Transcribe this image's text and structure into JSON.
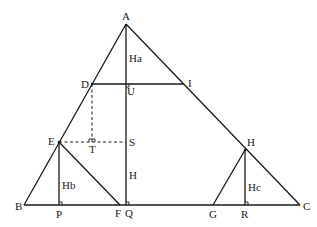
{
  "diagram": {
    "type": "geometry-figure",
    "points": {
      "A": "A",
      "B": "B",
      "C": "C",
      "D": "D",
      "E": "E",
      "F": "F",
      "G": "G",
      "H": "H",
      "I": "I",
      "P": "P",
      "Q": "Q",
      "R": "R",
      "S": "S",
      "T": "T",
      "U": "U"
    },
    "segment_labels": {
      "altitude_a": "Ha",
      "altitude_b": "Hb",
      "altitude_c": "Hc",
      "segment_h": "H"
    },
    "segments": [
      {
        "from": "A",
        "to": "B",
        "style": "solid"
      },
      {
        "from": "A",
        "to": "C",
        "style": "solid"
      },
      {
        "from": "B",
        "to": "C",
        "style": "solid"
      },
      {
        "from": "A",
        "to": "Q",
        "style": "solid"
      },
      {
        "from": "D",
        "to": "I",
        "style": "solid"
      },
      {
        "from": "E",
        "to": "P",
        "style": "solid"
      },
      {
        "from": "E",
        "to": "F",
        "style": "solid"
      },
      {
        "from": "H",
        "to": "G",
        "style": "solid"
      },
      {
        "from": "H",
        "to": "R",
        "style": "solid"
      },
      {
        "from": "D",
        "to": "T",
        "style": "dashed"
      },
      {
        "from": "E",
        "to": "S",
        "style": "dashed"
      }
    ],
    "right_angles": [
      "U",
      "S",
      "T",
      "P",
      "Q",
      "R"
    ]
  }
}
